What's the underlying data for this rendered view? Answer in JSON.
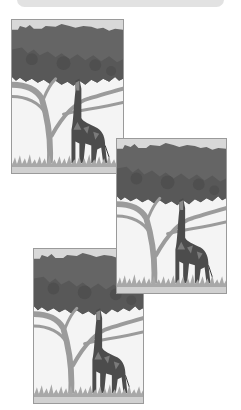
{
  "top_bar": {
    "color": "#e2e2e2"
  },
  "illustration": {
    "subject": "giraffe eating from acacia tree",
    "colors": {
      "sky": "#f4f4f4",
      "sky_top": "#d8d8d8",
      "canopy_dark": "#5f5f5f",
      "canopy_light": "#777777",
      "branches": "#9b9b9b",
      "giraffe": "#4a4a4a",
      "giraffe_light": "#8a8a8a",
      "grass": "#a8a8a8",
      "ground": "#d0d0d0",
      "border": "#9a9a9a"
    }
  },
  "panels": [
    {
      "label": "",
      "position": "top-left"
    },
    {
      "label": "",
      "position": "middle-right"
    },
    {
      "label": "",
      "position": "bottom-left"
    }
  ]
}
